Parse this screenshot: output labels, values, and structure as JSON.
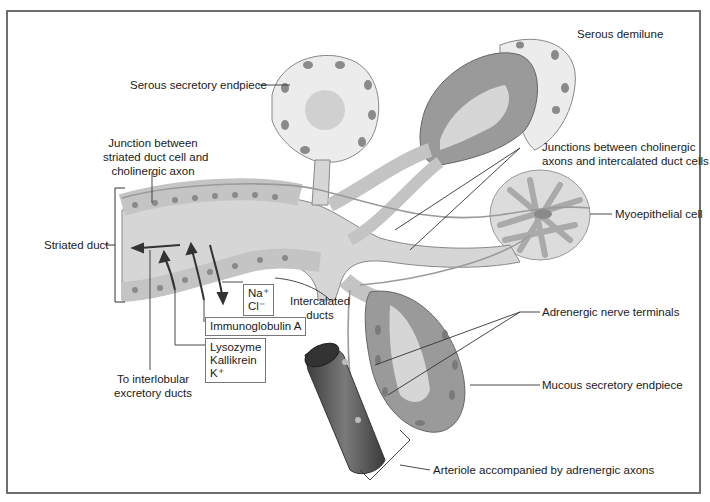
{
  "figure": {
    "type": "anatomical diagram",
    "colors": {
      "frame": "#6e6e6e",
      "duct_lumen": "#d6d6d6",
      "duct_cell": "#c4c4c4",
      "nucleus": "#8a8a8a",
      "mucous_cell": "#9a9a9a",
      "serous_cell": "#ececec",
      "arteriole": "#555555",
      "leader_line": "#333333"
    }
  },
  "labels": {
    "serous_demilune": "Serous demilune",
    "serous_secretory_endpiece": "Serous secretory endpiece",
    "junction_striated": [
      "Junction between",
      "striated duct cell and",
      "cholinergic axon"
    ],
    "junctions_intercalated": [
      "Junctions between cholinergic",
      "axons and intercalated duct cells"
    ],
    "myoepithelial_cell": "Myoepithelial cell",
    "striated_duct": "Striated duct",
    "intercalated_ducts": [
      "Intercalated",
      "ducts"
    ],
    "adrenergic_nerve_terminals": "Adrenergic nerve terminals",
    "mucous_secretory_endpiece": "Mucous secretory endpiece",
    "arteriole": "Arteriole accompanied by adrenergic axons",
    "to_interlobular": [
      "To interlobular",
      "excretory ducts"
    ]
  },
  "boxes": {
    "ions": [
      "Na⁺",
      "Cl⁻"
    ],
    "immunoglobulin": "Immunoglobulin A",
    "secretions": [
      "Lysozyme",
      "Kallikrein",
      "K⁺"
    ]
  }
}
